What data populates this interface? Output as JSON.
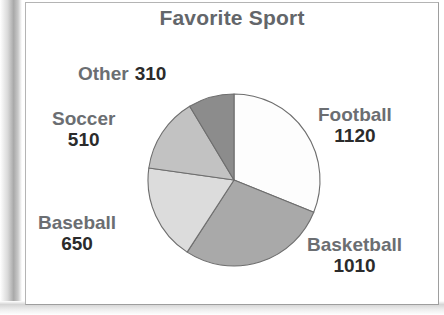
{
  "chart_data": {
    "type": "pie",
    "title": "Favorite Sport",
    "categories": [
      "Football",
      "Basketball",
      "Baseball",
      "Soccer",
      "Other"
    ],
    "values": [
      1120,
      1010,
      650,
      510,
      310
    ],
    "total": 3600,
    "labels": [
      {
        "name": "Football",
        "value": "1120",
        "color": "#fdfdfd",
        "start_deg": 0,
        "sweep_deg": 112,
        "position": "right-top"
      },
      {
        "name": "Basketball",
        "value": "1010",
        "color": "#a9a9a9",
        "start_deg": 112,
        "sweep_deg": 101,
        "position": "right-bottom"
      },
      {
        "name": "Baseball",
        "value": "650",
        "color": "#dcdcdc",
        "start_deg": 213,
        "sweep_deg": 65,
        "position": "left-bottom"
      },
      {
        "name": "Soccer",
        "value": "510",
        "color": "#c2c2c2",
        "start_deg": 278,
        "sweep_deg": 51,
        "position": "left-top"
      },
      {
        "name": "Other",
        "value": "310",
        "color": "#8c8c8c",
        "start_deg": 329,
        "sweep_deg": 31,
        "position": "top"
      }
    ],
    "legend": "none",
    "grid": false,
    "label_text_color": "#6b6e72",
    "value_text_color": "#2b2b2b",
    "slice_outline_color": "#6e6e6e",
    "background_color": "#ffffff"
  }
}
